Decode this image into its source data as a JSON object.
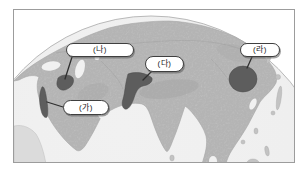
{
  "map": {
    "labels": [
      {
        "id": "ga",
        "text": "(가)"
      },
      {
        "id": "na",
        "text": "(나)"
      },
      {
        "id": "da",
        "text": "(다)"
      },
      {
        "id": "ra",
        "text": "(라)"
      }
    ],
    "colors": {
      "frame_border": "#9c9c9c",
      "ocean": "#f1f1f1",
      "land": "#c3c3c3",
      "land_faint": "#d8d8d8",
      "coastline": "#a8a8a8",
      "highland": "#9e9e9e",
      "border_lines": "#8f8f8f",
      "marked_region": "#5d5d5d",
      "marked_region_edge": "#4a4a4a",
      "connector": "#2f2f2f",
      "rim": "#b9b9b9",
      "callout_fill": "#ffffff",
      "callout_border": "#3f3f3f",
      "label_text": "#1c1c1c"
    }
  }
}
